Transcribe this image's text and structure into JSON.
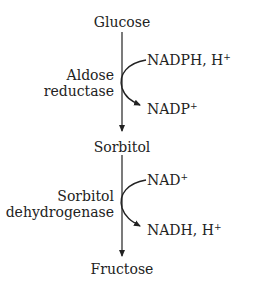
{
  "pathway": {
    "metabolites": [
      "Glucose",
      "Sorbitol",
      "Fructose"
    ],
    "steps": [
      {
        "enzyme_line1": "Aldose",
        "enzyme_line2": "reductase",
        "cofactor_in": "NADPH, H",
        "cofactor_in_sup": "+",
        "cofactor_out": "NADP",
        "cofactor_out_sup": "+"
      },
      {
        "enzyme_line1": "Sorbitol",
        "enzyme_line2": "dehydrogenase",
        "cofactor_in": "NAD",
        "cofactor_in_sup": "+",
        "cofactor_out": "NADH, H",
        "cofactor_out_sup": "+"
      }
    ]
  }
}
